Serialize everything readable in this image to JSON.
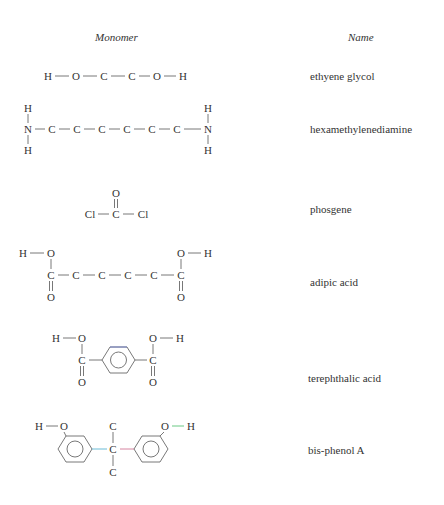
{
  "headers": {
    "monomer": "Monomer",
    "name": "Name"
  },
  "rows": [
    {
      "name": "ethyene glycol"
    },
    {
      "name": "hexamethylenediamine"
    },
    {
      "name": "phosgene"
    },
    {
      "name": "adipic acid"
    },
    {
      "name": "terephthalic acid"
    },
    {
      "name": "bis-phenol A"
    }
  ],
  "atoms": {
    "H": "H",
    "O": "O",
    "C": "C",
    "N": "N",
    "Cl": "Cl"
  },
  "bond_colors": {
    "ring_top_bond": "#6677cc",
    "bpa_left_bond": "#44aacc",
    "bpa_right_bond": "#cc6688",
    "bpa_oh_bond": "#44bb66"
  }
}
